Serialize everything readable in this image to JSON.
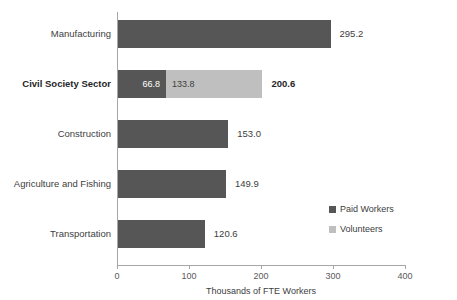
{
  "chart_data": {
    "type": "bar",
    "orientation": "horizontal",
    "stacked": true,
    "title": "",
    "xlabel": "Thousands of FTE Workers",
    "ylabel": "",
    "xlim": [
      0,
      400
    ],
    "xticks": [
      0,
      100,
      200,
      300,
      400
    ],
    "xtick_labels": [
      "0",
      "100",
      "200",
      "300",
      "400"
    ],
    "grid": false,
    "legend_position": "middle-right",
    "colors": {
      "paid_workers": "#565656",
      "volunteers": "#bfbfbf",
      "axis": "#a6a6a6",
      "text": "#404040",
      "background": "#ffffff"
    },
    "categories": [
      "Manufacturing",
      "Civil Society Sector",
      "Construction",
      "Agriculture and Fishing",
      "Transportation"
    ],
    "highlighted_category": "Civil Society Sector",
    "series": [
      {
        "name": "Paid Workers",
        "color": "#565656",
        "values": [
          295.2,
          66.8,
          153.0,
          149.9,
          120.6
        ]
      },
      {
        "name": "Volunteers",
        "color": "#bfbfbf",
        "values": [
          0,
          133.8,
          0,
          0,
          0
        ]
      }
    ],
    "totals": [
      295.2,
      200.6,
      153.0,
      149.9,
      120.6
    ],
    "rows": [
      {
        "category": "Manufacturing",
        "bold": false,
        "paid": 295.2,
        "volunteers": 0,
        "total": 295.2,
        "paid_label": "",
        "volunteers_label": "",
        "total_label": "295.2"
      },
      {
        "category": "Civil Society Sector",
        "bold": true,
        "paid": 66.8,
        "volunteers": 133.8,
        "total": 200.6,
        "paid_label": "66.8",
        "volunteers_label": "133.8",
        "total_label": "200.6"
      },
      {
        "category": "Construction",
        "bold": false,
        "paid": 153.0,
        "volunteers": 0,
        "total": 153.0,
        "paid_label": "",
        "volunteers_label": "",
        "total_label": "153.0"
      },
      {
        "category": "Agriculture and Fishing",
        "bold": false,
        "paid": 149.9,
        "volunteers": 0,
        "total": 149.9,
        "paid_label": "",
        "volunteers_label": "",
        "total_label": "149.9"
      },
      {
        "category": "Transportation",
        "bold": false,
        "paid": 120.6,
        "volunteers": 0,
        "total": 120.6,
        "paid_label": "",
        "volunteers_label": "",
        "total_label": "120.6"
      }
    ],
    "legend": [
      {
        "label": "Paid Workers",
        "color": "#565656"
      },
      {
        "label": "Volunteers",
        "color": "#bfbfbf"
      }
    ]
  }
}
